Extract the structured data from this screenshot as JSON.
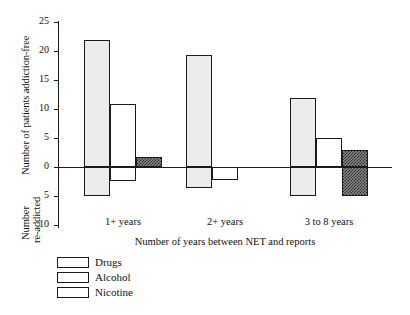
{
  "chart_data": {
    "type": "bar",
    "title": "",
    "subtitle": "",
    "xlabel": "Number of years between NET and reports",
    "ylabel_positive": "Number of patients addiction-free",
    "ylabel_negative_line1": "Number",
    "ylabel_negative_line2": "re-addicted",
    "categories": [
      "1+ years",
      "2+ years",
      "3 to 8 years"
    ],
    "series": [
      {
        "name": "Drugs",
        "color": "#ececec",
        "pattern": "light-gray-fill",
        "values_addiction_free": [
          21.9,
          19.3,
          11.9
        ],
        "values_re_addicted": [
          5.0,
          3.6,
          5.0
        ]
      },
      {
        "name": "Alcohol",
        "color": "#ffffff",
        "pattern": "white-fill",
        "values_addiction_free": [
          10.9,
          0.0,
          5.0
        ],
        "values_re_addicted": [
          2.4,
          2.2,
          0.0
        ]
      },
      {
        "name": "Nicotine",
        "color": "#8a8a8a",
        "pattern": "dark-crosshatch",
        "values_addiction_free": [
          1.7,
          0.0,
          2.9
        ],
        "values_re_addicted": [
          0.0,
          0.0,
          5.0
        ]
      }
    ],
    "y_ticks_positive": [
      "0",
      "5",
      "10",
      "15",
      "20",
      "25"
    ],
    "y_ticks_negative": [
      "5",
      "10"
    ],
    "ylim": [
      -10,
      25
    ],
    "grid": false,
    "legend_position": "bottom-left",
    "legend_entries": [
      "Drugs",
      "Alcohol",
      "Nicotine"
    ]
  },
  "axis": {
    "ticks": [
      {
        "label": "25",
        "value": 25
      },
      {
        "label": "20",
        "value": 20
      },
      {
        "label": "15",
        "value": 15
      },
      {
        "label": "10",
        "value": 10
      },
      {
        "label": "5",
        "value": 5
      },
      {
        "label": "0",
        "value": 0
      },
      {
        "label": "5",
        "value": -5
      },
      {
        "label": "10",
        "value": -10
      }
    ]
  }
}
